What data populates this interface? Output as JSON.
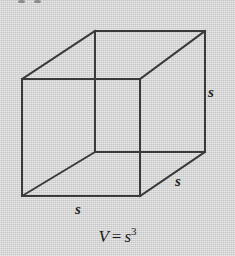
{
  "figure": {
    "background_color": "#d5d5d5",
    "line_color": "#3a3a3a",
    "text_color": "#1c1c1c",
    "shape": "cube",
    "projection": "oblique parallel"
  },
  "labels": {
    "right_edge": "s",
    "depth_edge": "s",
    "bottom_edge": "s"
  },
  "formula": {
    "variable": "V",
    "equals": "=",
    "base": "s",
    "exponent": "3",
    "full_text": "V = s³"
  },
  "geometry": {
    "front_face": {
      "top_left": [
        22,
        79
      ],
      "top_right": [
        140,
        79
      ],
      "bottom_right": [
        140,
        196
      ],
      "bottom_left": [
        22,
        196
      ]
    },
    "back_face": {
      "top_left": [
        95,
        31
      ],
      "top_right": [
        205,
        31
      ],
      "bottom_right": [
        205,
        152
      ],
      "bottom_left": [
        95,
        152
      ]
    },
    "stroke_width": 2
  }
}
